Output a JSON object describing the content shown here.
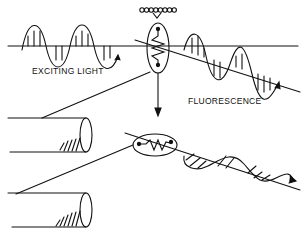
{
  "labels": {
    "exciting_light": "EXCITING LIGHT",
    "fluorescence": "FLUORESCENCE"
  },
  "elements": {
    "chain_beads": 8,
    "exciting_wave": "sinusoidal wave with vertical hatching along horizontal axis",
    "fluorescence_wave": "sinusoidal wave with vertical hatching along descending axis",
    "emitted_wave": "sinusoidal wave with diagonal hatching",
    "fluorophore_upright": "vertical ellipse containing zigzag dipole",
    "fluorophore_rotated": "horizontal ellipse containing zigzag dipole",
    "cylinders": 2
  },
  "colors": {
    "ink": "#111111",
    "background": "#ffffff"
  }
}
